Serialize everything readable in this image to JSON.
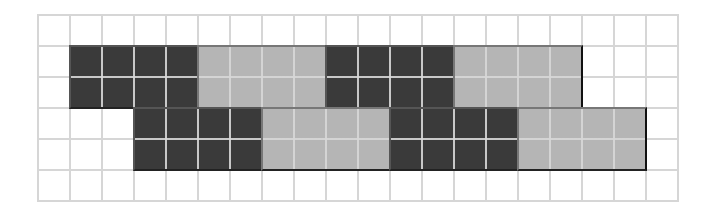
{
  "grid": {
    "columns": 20,
    "rows": 6,
    "cell_width": 32,
    "cell_height": 31,
    "line_color": "#d6d6d6",
    "background": "#ffffff"
  },
  "colors": {
    "dark": "#3a3a3a",
    "light": "#b5b5b5"
  },
  "blocks": [
    {
      "shade": "dark",
      "col": 1,
      "row": 1,
      "width": 4,
      "height": 2
    },
    {
      "shade": "light",
      "col": 5,
      "row": 1,
      "width": 4,
      "height": 2
    },
    {
      "shade": "dark",
      "col": 9,
      "row": 1,
      "width": 4,
      "height": 2
    },
    {
      "shade": "light",
      "col": 13,
      "row": 1,
      "width": 4,
      "height": 2
    },
    {
      "shade": "dark",
      "col": 3,
      "row": 3,
      "width": 4,
      "height": 2
    },
    {
      "shade": "light",
      "col": 7,
      "row": 3,
      "width": 4,
      "height": 2
    },
    {
      "shade": "dark",
      "col": 11,
      "row": 3,
      "width": 4,
      "height": 2
    },
    {
      "shade": "light",
      "col": 15,
      "row": 3,
      "width": 4,
      "height": 2
    }
  ]
}
